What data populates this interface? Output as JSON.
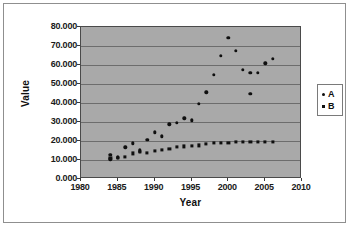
{
  "chart_data": {
    "type": "scatter",
    "title": "",
    "xlabel": "Year",
    "ylabel": "Value",
    "xlim": [
      1980,
      2010
    ],
    "ylim": [
      0,
      80
    ],
    "xticks": [
      "1980",
      "1985",
      "1990",
      "1995",
      "2000",
      "2005",
      "2010"
    ],
    "xtick_values": [
      1980,
      1985,
      1990,
      1995,
      2000,
      2005,
      2010
    ],
    "yticks": [
      "0.000",
      "10.000",
      "20.000",
      "30.000",
      "40.000",
      "50.000",
      "60.000",
      "70.000",
      "80.000"
    ],
    "ytick_values": [
      0,
      10,
      20,
      30,
      40,
      50,
      60,
      70,
      80
    ],
    "grid": true,
    "legend_position": "right",
    "plot_background": "#a9a9a9",
    "marker_color": "#0f0f0f",
    "series": [
      {
        "name": "A",
        "marker": "circle",
        "x": [
          1984,
          1984,
          1985,
          1985,
          1986,
          1987,
          1988,
          1988,
          1989,
          1990,
          1991,
          1992,
          1993,
          1994,
          1995,
          1996,
          1997,
          1998,
          1999,
          2000,
          2001,
          2002,
          2003,
          2003,
          2004,
          2005,
          2006
        ],
        "y": [
          12.8,
          10.4,
          11.5,
          11.1,
          16.6,
          18.8,
          15.2,
          14.4,
          20.6,
          24.6,
          22.4,
          28.7,
          29.6,
          31.9,
          30.8,
          39.6,
          45.6,
          55.0,
          64.7,
          74.4,
          67.5,
          57.5,
          44.8,
          55.9,
          55.8,
          60.8,
          63.2
        ]
      },
      {
        "name": "B",
        "marker": "square",
        "x": [
          1984,
          1985,
          1986,
          1987,
          1988,
          1989,
          1990,
          1991,
          1992,
          1993,
          1994,
          1995,
          1996,
          1997,
          1998,
          1999,
          2000,
          2001,
          2002,
          2003,
          2004,
          2005,
          2006
        ],
        "y": [
          11.0,
          11.2,
          11.8,
          13.5,
          14.2,
          13.8,
          14.7,
          15.3,
          15.9,
          16.7,
          17.2,
          17.4,
          17.7,
          18.4,
          18.8,
          19.1,
          19.2,
          19.4,
          19.6,
          19.7,
          19.7,
          19.6,
          19.5
        ]
      }
    ]
  },
  "legend": {
    "items": [
      {
        "label": "A",
        "marker": "circle"
      },
      {
        "label": "B",
        "marker": "square"
      }
    ]
  }
}
